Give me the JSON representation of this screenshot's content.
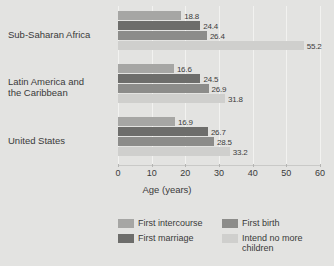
{
  "chart_data": {
    "type": "bar",
    "orientation": "horizontal",
    "title": "",
    "xlabel": "Age (years)",
    "ylabel": "",
    "xlim": [
      0,
      60
    ],
    "xticks": [
      0,
      10,
      20,
      30,
      40,
      50,
      60
    ],
    "grid": true,
    "legend_position": "bottom",
    "categories": [
      "Sub-Saharan Africa",
      "Latin America and\nthe Caribbean",
      "United States"
    ],
    "series": [
      {
        "name": "First intercourse",
        "color": "#a6a6a4",
        "values": [
          18.8,
          16.6,
          16.9
        ]
      },
      {
        "name": "First marriage",
        "color": "#6d6d6b",
        "values": [
          24.4,
          24.5,
          26.7
        ]
      },
      {
        "name": "First birth",
        "color": "#8c8c8a",
        "values": [
          26.4,
          26.9,
          28.5
        ]
      },
      {
        "name": "Intend no more children",
        "color": "#cfcfcd",
        "values": [
          55.2,
          31.8,
          33.2
        ]
      }
    ],
    "data_labels": [
      [
        "18.8",
        "24.4",
        "26.4",
        "55.2"
      ],
      [
        "16.6",
        "24.5",
        "26.9",
        "31.8"
      ],
      [
        "16.9",
        "26.7",
        "28.5",
        "33.2"
      ]
    ],
    "background_color": "#e3e3e1",
    "gridline_color": "#f2f2f0"
  },
  "legend": {
    "entries": [
      {
        "label": "First intercourse",
        "color": "#a6a6a4"
      },
      {
        "label": "First birth",
        "color": "#8c8c8a"
      },
      {
        "label": "First marriage",
        "color": "#6d6d6b"
      },
      {
        "label": "Intend no more children",
        "color": "#cfcfcd"
      }
    ]
  }
}
